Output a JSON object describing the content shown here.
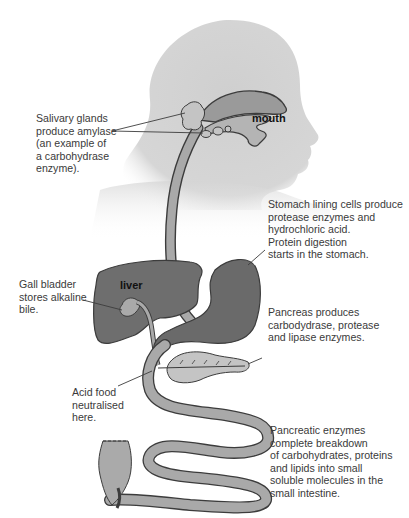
{
  "diagram": {
    "organ_labels": {
      "mouth": "mouth",
      "liver": "liver"
    },
    "annotations": {
      "salivary": "Salivary glands\nproduce amylase\n(an example of\na carbohydrase\nenzyme).",
      "stomach": "Stomach lining cells produce\nprotease enzymes and\nhydrochloric acid.\nProtein digestion\nstarts in the stomach.",
      "gall_bladder": "Gall bladder\nstores alkaline\nbile.",
      "pancreas": "Pancreas produces\ncarbodydrase, protease\nand lipase enzymes.",
      "acid_food": "Acid food\nneutralised\nhere.",
      "small_intestine": "Pancreatic enzymes\ncomplete breakdown\nof carbohydrates, proteins\nand lipids into small\nsoluble molecules in the\nsmall intestine."
    },
    "colors": {
      "head": "#d2d2d2",
      "liver": "#6e6e6e",
      "stomach": "#6a6a6a",
      "tube": "#a9a9a9",
      "gland": "#c4c4c4",
      "outline": "#3c3c3c"
    }
  }
}
